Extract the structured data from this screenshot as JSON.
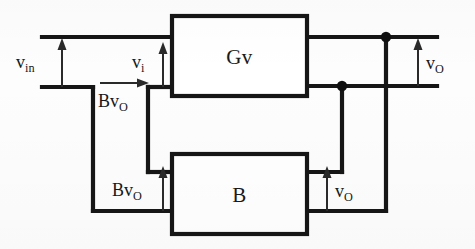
{
  "figure": {
    "type": "block-diagram",
    "background_color": "#fdfdfd",
    "line_color": "#161616"
  },
  "blocks": [
    {
      "id": "gv",
      "label": "Gv",
      "x": 172,
      "y": 16,
      "width": 135,
      "height": 80
    },
    {
      "id": "b",
      "label": "B",
      "x": 172,
      "y": 154,
      "width": 135,
      "height": 80
    }
  ],
  "labels": {
    "v_in": {
      "base": "v",
      "sub": "in",
      "text": "v in"
    },
    "v_i": {
      "base": "v",
      "sub": "i",
      "text": "v i"
    },
    "bv_o_top": {
      "base": "Bv",
      "sub": "O",
      "text": "Bv O"
    },
    "bv_o_bottom": {
      "base": "Bv",
      "sub": "O",
      "text": "Bv O"
    },
    "v_o_right": {
      "base": "v",
      "sub": "O",
      "text": "v O"
    },
    "v_o_bottom": {
      "base": "v",
      "sub": "O",
      "text": "v O"
    }
  },
  "nodes": [
    {
      "id": "output-node-top",
      "x": 386,
      "y": 37
    },
    {
      "id": "feedback-node",
      "x": 342,
      "y": 86
    }
  ],
  "arrows": [
    {
      "id": "v-in-arrow",
      "direction": "up",
      "x": 62,
      "y_from": 87,
      "y_to": 40
    },
    {
      "id": "v-i-arrow",
      "direction": "up",
      "x": 163,
      "y_from": 87,
      "y_to": 44
    },
    {
      "id": "bv-o-top-arrow",
      "direction": "right",
      "y": 83,
      "x_from": 100,
      "x_to": 147
    },
    {
      "id": "bv-o-bottom-arrow",
      "direction": "up",
      "x": 163,
      "y_from": 211,
      "y_to": 168
    },
    {
      "id": "v-o-right-arrow",
      "direction": "up",
      "x": 418,
      "y_from": 86,
      "y_to": 40
    },
    {
      "id": "v-o-bottom-arrow",
      "direction": "up",
      "x": 327,
      "y_from": 211,
      "y_to": 168
    }
  ]
}
